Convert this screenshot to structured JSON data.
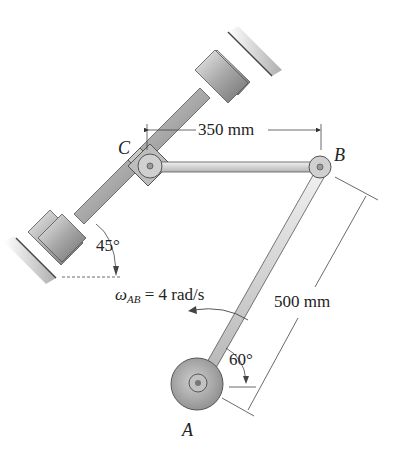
{
  "diagram": {
    "type": "mechanism",
    "points": {
      "A": {
        "label": "A"
      },
      "B": {
        "label": "B"
      },
      "C": {
        "label": "C"
      }
    },
    "dimensions": {
      "CB": "350 mm",
      "AB": "500 mm"
    },
    "angles": {
      "guide": "45°",
      "link_AB": "60°"
    },
    "angular_velocity": {
      "symbol": "ω",
      "subscript": "AB",
      "value": "= 4 rad/s"
    },
    "colors": {
      "background": "#ffffff",
      "metal_light": "#d9d9d9",
      "metal_dark": "#8a8a8a",
      "outline": "#555555",
      "text": "#222222"
    }
  }
}
